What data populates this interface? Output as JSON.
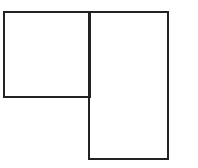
{
  "diagram": {
    "stroke_color": "#222222",
    "background_color": "#ffffff",
    "shapes": [
      {
        "id": "left-square",
        "type": "rectangle",
        "x": 3,
        "y": 11,
        "width": 88,
        "height": 87
      },
      {
        "id": "right-rectangle",
        "type": "rectangle",
        "x": 88,
        "y": 11,
        "width": 81,
        "height": 149
      }
    ]
  }
}
